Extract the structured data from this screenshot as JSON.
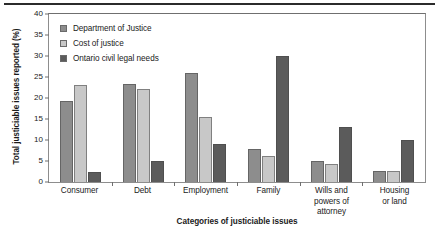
{
  "chart_data": {
    "type": "bar",
    "title": "",
    "xlabel": "Categories of justiciable issues",
    "ylabel": "Total justiciable issues reported (%)",
    "ylim": [
      0,
      40
    ],
    "yticks": [
      0,
      5,
      10,
      15,
      20,
      25,
      30,
      35,
      40
    ],
    "grid": false,
    "legend_position": "top-left-inside",
    "categories": [
      "Consumer",
      "Debt",
      "Employment",
      "Family",
      "Wills and\npowers of attorney",
      "Housing\nor land"
    ],
    "category_lines": [
      [
        "Consumer"
      ],
      [
        "Debt"
      ],
      [
        "Employment"
      ],
      [
        "Family"
      ],
      [
        "Wills and",
        "powers of attorney"
      ],
      [
        "Housing",
        "or land"
      ]
    ],
    "series": [
      {
        "name": "Department of Justice",
        "color": "#8d8d8d",
        "values": [
          19.3,
          23.4,
          26.0,
          7.8,
          5.1,
          2.7
        ]
      },
      {
        "name": "Cost of justice",
        "color": "#c8c8c8",
        "values": [
          23.0,
          22.2,
          15.4,
          6.1,
          4.2,
          2.7
        ]
      },
      {
        "name": "Ontario civil legal needs",
        "color": "#5b5b5b",
        "values": [
          2.3,
          5.0,
          9.1,
          30.0,
          13.0,
          10.0
        ]
      }
    ]
  },
  "axis": {
    "tick_labels": [
      "0",
      "5",
      "10",
      "15",
      "20",
      "25",
      "30",
      "35",
      "40"
    ]
  }
}
